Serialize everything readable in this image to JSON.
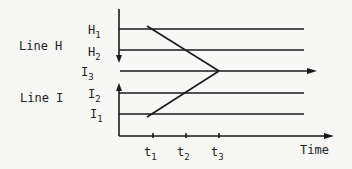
{
  "diagram": {
    "left_labels": {
      "line_h": "Line H",
      "line_i": "Line I"
    },
    "level_labels": {
      "h1": {
        "base": "H",
        "sub": "1"
      },
      "h2": {
        "base": "H",
        "sub": "2"
      },
      "i3": {
        "base": "I",
        "sub": "3"
      },
      "i2": {
        "base": "I",
        "sub": "2"
      },
      "i1": {
        "base": "I",
        "sub": "1"
      }
    },
    "time_ticks": [
      {
        "base": "t",
        "sub": "1"
      },
      {
        "base": "t",
        "sub": "2"
      },
      {
        "base": "t",
        "sub": "3"
      }
    ],
    "x_axis_label": "Time",
    "line_color": "#1a1a1a"
  }
}
